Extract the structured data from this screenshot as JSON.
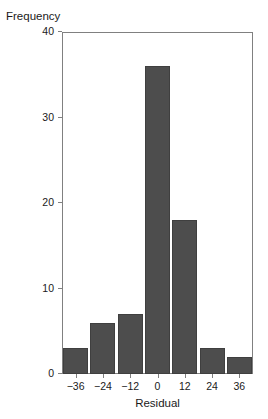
{
  "chart_data": {
    "type": "bar",
    "title": "",
    "xlabel": "Residual",
    "ylabel": "Frequency",
    "categories": [
      "-36",
      "-24",
      "-12",
      "0",
      "12",
      "24",
      "36"
    ],
    "values": [
      3,
      6,
      7,
      36,
      18,
      3,
      2
    ],
    "xtick_labels": [
      "−36",
      "−24",
      "−12",
      "0",
      "12",
      "24",
      "36"
    ],
    "ytick_labels": [
      "0",
      "10",
      "20",
      "30",
      "40"
    ],
    "ytick_values": [
      0,
      10,
      20,
      30,
      40
    ],
    "ylim": [
      0,
      40
    ],
    "xlim": [
      -42,
      42
    ],
    "bin_width": 12,
    "grid": false,
    "legend": null,
    "bar_color": "#4d4d4d",
    "axis_color": "#808080",
    "text_color": "#1a1a1a",
    "background": "#ffffff"
  }
}
